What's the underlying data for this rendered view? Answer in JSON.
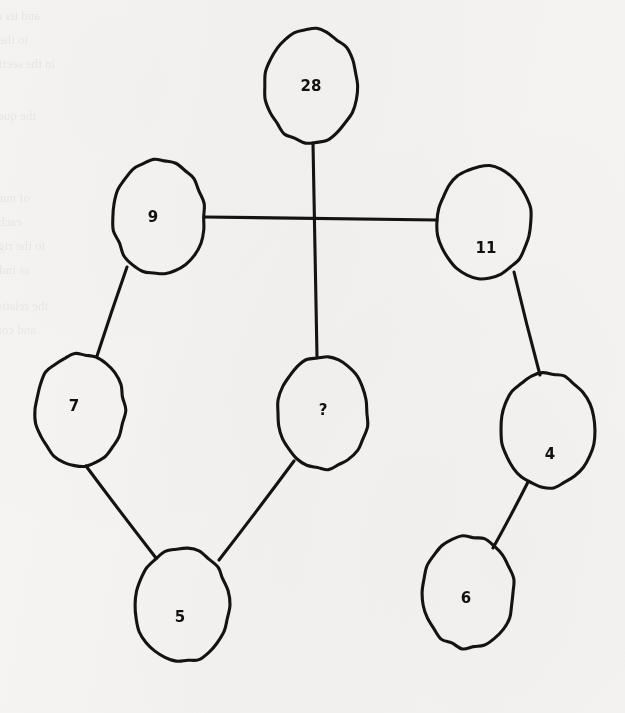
{
  "page": {
    "background_color": "#f4f3f1",
    "ink_color": "#16120f",
    "width": 625,
    "height": 713
  },
  "ghost_text": {
    "note": "faint mirrored bleed-through from the reverse side of the paper; illegible",
    "lines": [
      {
        "text": "and its contribution",
        "x": 40,
        "y": 8,
        "size": 13
      },
      {
        "text": "to the answers given",
        "x": 28,
        "y": 32,
        "size": 13
      },
      {
        "text": "in the section",
        "x": 55,
        "y": 56,
        "size": 13
      },
      {
        "text": "the question",
        "x": 36,
        "y": 108,
        "size": 13
      },
      {
        "text": "of numbers in",
        "x": 30,
        "y": 190,
        "size": 13
      },
      {
        "text": "each of the series shown",
        "x": 22,
        "y": 214,
        "size": 13
      },
      {
        "text": "to the right and left",
        "x": 45,
        "y": 238,
        "size": 13
      },
      {
        "text": "as indicated above",
        "x": 30,
        "y": 262,
        "size": 13
      },
      {
        "text": "the relation between",
        "x": 48,
        "y": 298,
        "size": 13
      },
      {
        "text": "and complete the",
        "x": 36,
        "y": 322,
        "size": 13
      }
    ]
  },
  "chart_data": {
    "type": "diagram",
    "subtype": "node-link-graph",
    "nodes": [
      {
        "id": "n28",
        "label": "28",
        "cx": 311,
        "cy": 86,
        "rx": 46,
        "ry": 57,
        "label_dx": 0,
        "label_dy": 0
      },
      {
        "id": "n9",
        "label": "9",
        "cx": 159,
        "cy": 217,
        "rx": 46,
        "ry": 57,
        "label_dx": -6,
        "label_dy": 0
      },
      {
        "id": "n11",
        "label": "11",
        "cx": 484,
        "cy": 222,
        "rx": 47,
        "ry": 56,
        "label_dx": 2,
        "label_dy": 26
      },
      {
        "id": "n7",
        "label": "7",
        "cx": 80,
        "cy": 410,
        "rx": 45,
        "ry": 56,
        "label_dx": -6,
        "label_dy": -4
      },
      {
        "id": "nq",
        "label": "?",
        "cx": 323,
        "cy": 413,
        "rx": 45,
        "ry": 56,
        "label_dx": 0,
        "label_dy": -3
      },
      {
        "id": "n4",
        "label": "4",
        "cx": 548,
        "cy": 430,
        "rx": 47,
        "ry": 57,
        "label_dx": 2,
        "label_dy": 24
      },
      {
        "id": "n5",
        "label": "5",
        "cx": 182,
        "cy": 605,
        "rx": 47,
        "ry": 57,
        "label_dx": -2,
        "label_dy": 12
      },
      {
        "id": "n6",
        "label": "6",
        "cx": 468,
        "cy": 592,
        "rx": 46,
        "ry": 56,
        "label_dx": -2,
        "label_dy": 6
      }
    ],
    "edges": [
      {
        "from": "n28",
        "to": "nq",
        "x1": 313,
        "y1": 143,
        "x2": 317,
        "y2": 357
      },
      {
        "from": "n9",
        "to": "n11",
        "x1": 205,
        "y1": 217,
        "x2": 437,
        "y2": 220
      },
      {
        "from": "n9",
        "to": "n7",
        "x1": 127,
        "y1": 267,
        "x2": 97,
        "y2": 356
      },
      {
        "from": "n7",
        "to": "n5",
        "x1": 86,
        "y1": 466,
        "x2": 156,
        "y2": 558
      },
      {
        "from": "n5",
        "to": "nq",
        "x1": 219,
        "y1": 560,
        "x2": 294,
        "y2": 461
      },
      {
        "from": "n11",
        "to": "n4",
        "x1": 514,
        "y1": 272,
        "x2": 540,
        "y2": 375
      },
      {
        "from": "n4",
        "to": "n6",
        "x1": 528,
        "y1": 482,
        "x2": 493,
        "y2": 548
      }
    ],
    "crossing_points": [
      {
        "x": 314,
        "y": 218,
        "note": "vertical edge 28-? crosses horizontal edge 9-11 without joining"
      }
    ],
    "node_count": 8,
    "edge_count": 7,
    "unknown_node": "?",
    "values": [
      28,
      9,
      11,
      7,
      null,
      4,
      5,
      6
    ]
  }
}
